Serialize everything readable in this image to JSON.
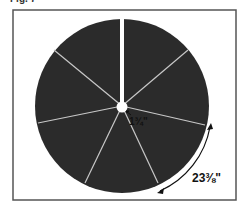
{
  "figure": {
    "label": "Fig. 7",
    "segments": 7,
    "colors": {
      "fill": "#2b2b2b",
      "lines": "#c8c8c8",
      "frame": "#555555",
      "text": "#111111"
    }
  },
  "dimensions": {
    "inner_radius": "1¾\"",
    "arc_length": "23⅜\""
  }
}
